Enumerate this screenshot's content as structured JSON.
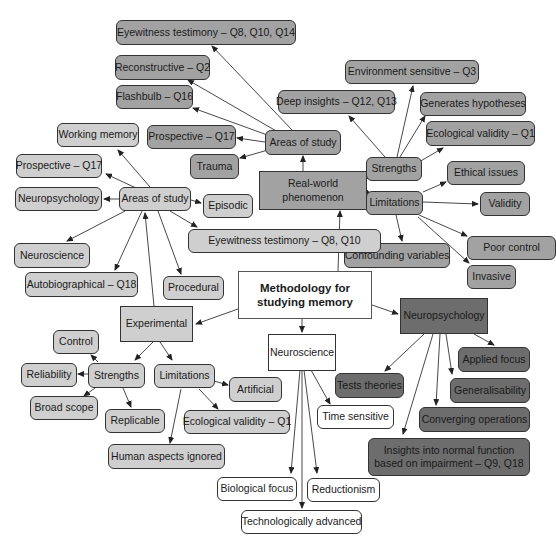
{
  "diagram": {
    "title": "Methodology for studying memory",
    "colors": {
      "light_grey": "#cfcfcf",
      "mid_grey": "#a2a2a2",
      "dark_grey": "#6d6d6d",
      "white": "#ffffff",
      "line": "#333333"
    },
    "nodes": {
      "center": "Methodology for studying memory",
      "real_world": "Real-world phenomenon",
      "rw_areas": "Areas of study",
      "rw_area_eyewitness": "Eyewitness testimony – Q8, Q10, Q14",
      "rw_area_reconstructive": "Reconstructive – Q2",
      "rw_area_flashbulb": "Flashbulb – Q16",
      "rw_area_prospective": "Prospective – Q17",
      "rw_area_trauma": "Trauma",
      "rw_strengths": "Strengths",
      "rw_str_environment": "Environment sensitive – Q3",
      "rw_str_deep": "Deep insights – Q12, Q13",
      "rw_str_hypotheses": "Generates hypotheses",
      "rw_str_ecological": "Ecological validity – Q1",
      "rw_limitations": "Limitations",
      "rw_lim_ethical": "Ethical issues",
      "rw_lim_validity": "Validity",
      "rw_lim_confounding": "Confounding variables",
      "rw_lim_poor_control": "Poor control",
      "rw_lim_invasive": "Invasive",
      "experimental": "Experimental",
      "ex_areas": "Areas of study",
      "ex_area_working": "Working memory",
      "ex_area_prospective": "Prospective – Q17",
      "ex_area_neuropsych": "Neuropsychology",
      "ex_area_neuroscience": "Neuroscience",
      "ex_area_autobiographical": "Autobiographical – Q18",
      "ex_area_procedural": "Procedural",
      "ex_area_episodic": "Episodic",
      "ex_area_eyewitness": "Eyewitness testimony – Q8, Q10",
      "ex_strengths": "Strengths",
      "ex_str_control": "Control",
      "ex_str_reliability": "Reliability",
      "ex_str_broad": "Broad scope",
      "ex_str_replicable": "Replicable",
      "ex_limitations": "Limitations",
      "ex_lim_artificial": "Artificial",
      "ex_lim_ecological": "Ecological validity – Q1",
      "ex_lim_human": "Human aspects ignored",
      "neuroscience": "Neuroscience",
      "ns_time": "Time sensitive",
      "ns_biological": "Biological focus",
      "ns_reductionism": "Reductionism",
      "ns_tech": "Technologically advanced",
      "neuropsychology": "Neuropsychology",
      "np_tests": "Tests theories",
      "np_applied": "Applied focus",
      "np_general": "Generalisability",
      "np_converging": "Converging operations",
      "np_insights": "Insights into normal function based on impairment – Q9, Q18"
    }
  }
}
